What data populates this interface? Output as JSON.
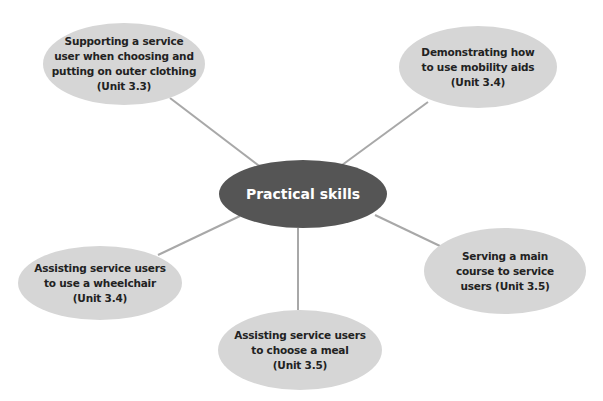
{
  "diagram": {
    "type": "mind-map",
    "colors": {
      "center_fill": "#555555",
      "node_fill": "#d6d6d6",
      "connector": "#a8a8a8",
      "center_text": "#ffffff",
      "node_text": "#222222"
    },
    "center": {
      "label": "Practical skills"
    },
    "nodes": [
      {
        "id": "outer-clothing",
        "label": "Supporting a service user when choosing and putting on outer clothing (Unit 3.3)",
        "lines": [
          "Supporting a service",
          "user when choosing and",
          "putting on outer clothing",
          "(Unit 3.3)"
        ]
      },
      {
        "id": "mobility-aids",
        "label": "Demonstrating how to use mobility aids (Unit 3.4)",
        "lines": [
          "Demonstrating how",
          "to use mobility aids",
          "(Unit 3.4)"
        ]
      },
      {
        "id": "wheelchair",
        "label": "Assisting service users to use a wheelchair (Unit 3.4)",
        "lines": [
          "Assisting service users",
          "to use a wheelchair",
          "(Unit 3.4)"
        ]
      },
      {
        "id": "choose-meal",
        "label": "Assisting service users to choose a meal (Unit 3.5)",
        "lines": [
          "Assisting service users",
          "to choose a meal",
          "(Unit 3.5)"
        ]
      },
      {
        "id": "main-course",
        "label": "Serving a main course to service users (Unit 3.5)",
        "lines": [
          "Serving a main",
          "course to service",
          "users (Unit 3.5)"
        ]
      }
    ]
  }
}
